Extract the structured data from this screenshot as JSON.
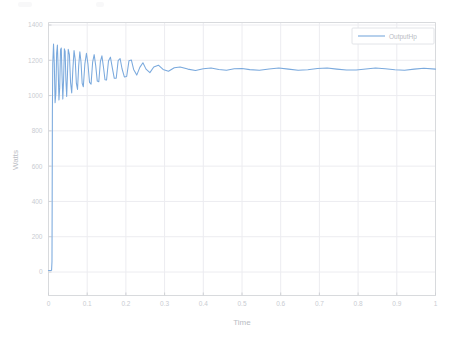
{
  "chart_data": {
    "type": "line",
    "title": "",
    "xlabel": "Time",
    "ylabel": "Watts",
    "xlim": [
      0,
      1
    ],
    "ylim": [
      0,
      1400
    ],
    "xticks": [
      "0",
      "0.1",
      "0.2",
      "0.3",
      "0.4",
      "0.5",
      "0.6",
      "0.7",
      "0.8",
      "0.9",
      "1"
    ],
    "xtick_values": [
      0,
      0.1,
      0.2,
      0.3,
      0.4,
      0.5,
      0.6,
      0.7,
      0.8,
      0.9,
      1
    ],
    "yticks": [
      "0",
      "200",
      "400",
      "600",
      "800",
      "1000",
      "1200",
      "1400"
    ],
    "ytick_values": [
      0,
      200,
      400,
      600,
      800,
      1000,
      1200,
      1400
    ],
    "grid": true,
    "legend_position": "top-right",
    "series": [
      {
        "name": "OutputHp",
        "color": "#7aa9dd",
        "description": "Damped step response settling near 1150 Watts",
        "x": [
          0,
          0.002,
          0.004,
          0.006,
          0.008,
          0.009,
          0.0095,
          0.01,
          0.011,
          0.013,
          0.015,
          0.017,
          0.019,
          0.021,
          0.023,
          0.025,
          0.027,
          0.029,
          0.031,
          0.033,
          0.035,
          0.037,
          0.039,
          0.041,
          0.043,
          0.045,
          0.047,
          0.049,
          0.051,
          0.054,
          0.057,
          0.06,
          0.063,
          0.066,
          0.069,
          0.072,
          0.075,
          0.078,
          0.081,
          0.084,
          0.087,
          0.09,
          0.094,
          0.098,
          0.102,
          0.106,
          0.11,
          0.114,
          0.118,
          0.122,
          0.126,
          0.13,
          0.134,
          0.138,
          0.142,
          0.146,
          0.15,
          0.155,
          0.16,
          0.165,
          0.17,
          0.175,
          0.18,
          0.185,
          0.19,
          0.196,
          0.202,
          0.208,
          0.214,
          0.22,
          0.228,
          0.236,
          0.244,
          0.252,
          0.262,
          0.272,
          0.284,
          0.296,
          0.31,
          0.325,
          0.34,
          0.36,
          0.38,
          0.4,
          0.42,
          0.44,
          0.46,
          0.48,
          0.5,
          0.52,
          0.545,
          0.57,
          0.595,
          0.62,
          0.645,
          0.67,
          0.695,
          0.72,
          0.745,
          0.77,
          0.795,
          0.82,
          0.845,
          0.87,
          0.895,
          0.92,
          0.945,
          0.97,
          1.0
        ],
        "y": [
          8,
          8,
          8,
          8,
          10,
          60,
          420,
          900,
          1180,
          1292,
          1180,
          960,
          1010,
          1240,
          1286,
          1150,
          975,
          1045,
          1258,
          1270,
          1110,
          980,
          1090,
          1265,
          1250,
          1085,
          995,
          1120,
          1262,
          1232,
          1075,
          1015,
          1150,
          1255,
          1205,
          1070,
          1035,
          1168,
          1248,
          1190,
          1070,
          1050,
          1180,
          1240,
          1178,
          1075,
          1065,
          1188,
          1232,
          1170,
          1082,
          1078,
          1192,
          1225,
          1162,
          1090,
          1088,
          1196,
          1218,
          1156,
          1098,
          1098,
          1198,
          1210,
          1152,
          1106,
          1108,
          1198,
          1202,
          1148,
          1116,
          1160,
          1186,
          1150,
          1130,
          1162,
          1172,
          1148,
          1138,
          1158,
          1162,
          1150,
          1142,
          1152,
          1156,
          1148,
          1144,
          1152,
          1154,
          1147,
          1143,
          1151,
          1156,
          1150,
          1144,
          1146,
          1153,
          1156,
          1150,
          1145,
          1145,
          1151,
          1156,
          1152,
          1146,
          1144,
          1150,
          1155,
          1150
        ]
      }
    ]
  },
  "legend": {
    "entries": [
      {
        "label": "OutputHp",
        "color": "#7aa9dd"
      }
    ]
  },
  "colors": {
    "series": "#7aa9dd",
    "grid": "#ececf0",
    "axis": "#d8dadd",
    "tick_text": "#c9ccd2",
    "background": "#ffffff"
  }
}
